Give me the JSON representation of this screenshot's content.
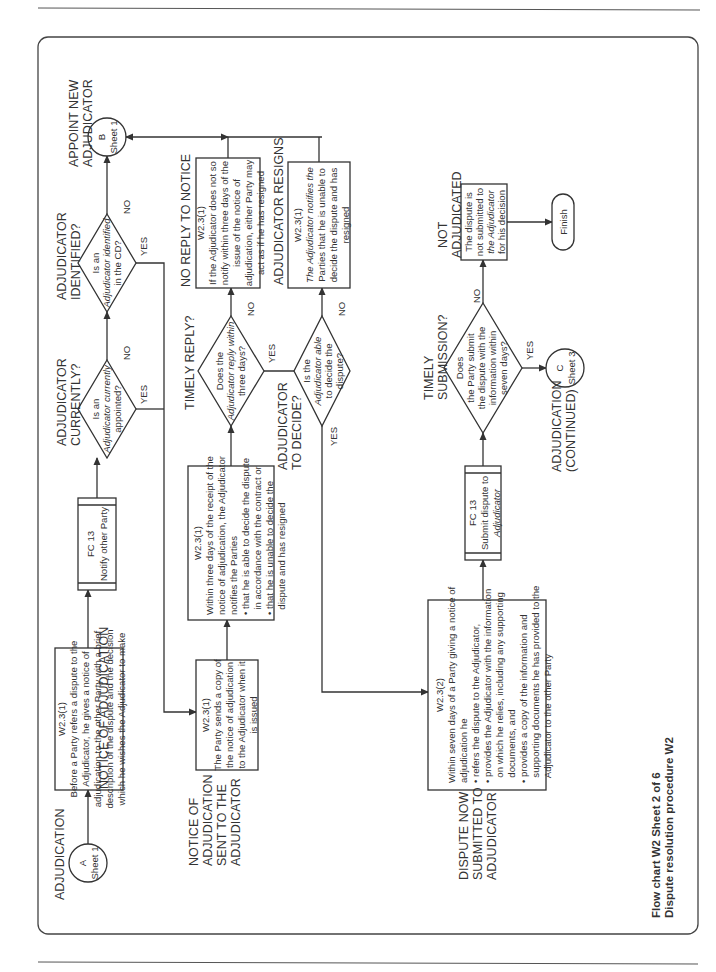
{
  "page": {
    "footer": {
      "line1": "Flow chart W2 Sheet 2 of 6",
      "line2": "Dispute resolution procedure W2"
    }
  },
  "labels": {
    "yes": "YES",
    "no": "NO"
  },
  "sections": {
    "adjudication": "ADJUDICATION",
    "notice_of_adjudication": "NOTICE OF ADJUDICATION",
    "adjudicator_currently_1": "ADJUDICATOR",
    "adjudicator_currently_2": "CURRENTLY?",
    "adjudicator_identified_1": "ADJUDICATOR",
    "adjudicator_identified_2": "IDENTIFIED?",
    "appoint_new_1": "APPOINT NEW",
    "appoint_new_2": "ADJUDICATOR",
    "notice_sent_1": "NOTICE OF",
    "notice_sent_2": "ADJUDICATION",
    "notice_sent_3": "SENT TO THE",
    "notice_sent_4": "ADJUDICATOR",
    "timely_reply": "TIMELY REPLY?",
    "no_reply": "NO REPLY TO NOTICE",
    "adjudicator_to_decide_1": "ADJUDICATOR",
    "adjudicator_to_decide_2": "TO DECIDE?",
    "adjudicator_resigns": "ADJUDICATOR RESIGNS",
    "dispute_submitted_1": "DISPUTE NOW",
    "dispute_submitted_2": "SUBMITTED TO",
    "dispute_submitted_3": "ADJUDICATOR",
    "timely_submission_1": "TIMELY",
    "timely_submission_2": "SUBMISSION?",
    "adjudication_continued_1": "ADJUDICATION",
    "adjudication_continued_2": "(CONTINUED)",
    "not_adjudicated_1": "NOT",
    "not_adjudicated_2": "ADJUDICATED"
  },
  "connectors": {
    "a": {
      "letter": "A",
      "sheet": "Sheet 1"
    },
    "b": {
      "letter": "B",
      "sheet": "Sheet 1"
    },
    "c": {
      "letter": "C",
      "sheet": "Sheet 3"
    }
  },
  "nodes": {
    "notice": {
      "ref": "W2.3(1)",
      "lines": [
        "Before a Party refers a dispute to the",
        "Adjudicator, he gives a notice of",
        "adjudication to the other Party with a brief",
        "description of the dispute and the decision",
        "which he wishes the Adjudicator to make"
      ]
    },
    "notify_other": {
      "ref": "FC 13",
      "text": "Notify other Party"
    },
    "currently_appointed": {
      "lines": [
        "Is an",
        "Adjudicator currently",
        "appointed?"
      ]
    },
    "identified_cd": {
      "lines": [
        "Is an",
        "Adjudicator identified",
        "in the CD?"
      ]
    },
    "party_sends": {
      "ref": "W2.3(1)",
      "lines": [
        "The Party sends a copy of",
        "the notice of adjudication",
        "to the Adjudicator when it",
        "is issued"
      ]
    },
    "within_three_days": {
      "ref": "W2.3(1)",
      "lines": [
        "Within three days of the receipt of the",
        "notice of adjudication, the Adjudicator",
        "notifies the Parties",
        "• that he is able to decide the dispute",
        "  in accordance with the contract or",
        "• that he is unable to decide the",
        "  dispute and has resigned"
      ]
    },
    "reply_three_days": {
      "lines": [
        "Does the",
        "Adjudicator reply within",
        "three days?"
      ]
    },
    "no_reply_box": {
      "ref": "W2.3(1)",
      "lines": [
        "If the Adjudicator does not so",
        "notify within three days of the",
        "issue of the notice of",
        "adjudication, either Party may",
        "act as if he has resigned"
      ]
    },
    "able_to_decide": {
      "lines": [
        "Is the",
        "Adjudicator able",
        "to decide the",
        "dispute?"
      ]
    },
    "resigns_box": {
      "ref": "W2.3(1)",
      "lines": [
        "The Adjudicator notifies the",
        "Parties that he is unable to",
        "decide the dispute and has",
        "resigned"
      ]
    },
    "within_seven_days": {
      "ref": "W2.3(2)",
      "lines": [
        "Within seven days of a Party giving a notice of",
        "adjudication he",
        "• refers the dispute to the Adjudicator,",
        "• provides the Adjudicator with the information",
        "  on which he relies, including any supporting",
        "  documents, and",
        "• provides a copy of the information and",
        "  supporting documents he has provided to the",
        "  Adjudicator to the other Party"
      ]
    },
    "submit_dispute": {
      "ref": "FC 13",
      "lines": [
        "Submit dispute to",
        "Adjudicator"
      ]
    },
    "submit_seven_days": {
      "lines": [
        "Does",
        "the Party submit",
        "the dispute with the",
        "information within",
        "seven days?"
      ]
    },
    "not_adjudicated_box": {
      "lines": [
        "The dispute is",
        "not submitted to",
        "the Adjudicator",
        "for his decision"
      ]
    },
    "finish": {
      "text": "Finish"
    }
  }
}
